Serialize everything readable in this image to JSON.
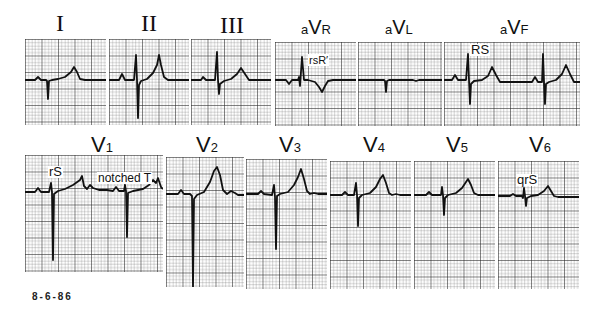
{
  "figure": {
    "date": "8-6-86",
    "colors": {
      "trace": "#111111",
      "grid_minor": "#555555",
      "grid_major": "#222222",
      "background": "#ffffff"
    }
  },
  "limb_leads": [
    {
      "id": "I",
      "label": "I",
      "prefix": "",
      "main": "",
      "sub": ""
    },
    {
      "id": "II",
      "label": "II",
      "prefix": "",
      "main": "",
      "sub": ""
    },
    {
      "id": "III",
      "label": "III",
      "prefix": "",
      "main": "",
      "sub": ""
    },
    {
      "id": "aVR",
      "label": "",
      "prefix": "a",
      "main": "V",
      "sub": "R",
      "annotation": "rsR′"
    },
    {
      "id": "aVL",
      "label": "",
      "prefix": "a",
      "main": "V",
      "sub": "L"
    },
    {
      "id": "aVF",
      "label": "",
      "prefix": "a",
      "main": "V",
      "sub": "F",
      "annotation": "RS"
    }
  ],
  "chest_leads": [
    {
      "id": "V1",
      "main": "V",
      "sub": "1",
      "annotation": "rS",
      "annotation2": "notched T"
    },
    {
      "id": "V2",
      "main": "V",
      "sub": "2"
    },
    {
      "id": "V3",
      "main": "V",
      "sub": "3"
    },
    {
      "id": "V4",
      "main": "V",
      "sub": "4"
    },
    {
      "id": "V5",
      "main": "V",
      "sub": "5"
    },
    {
      "id": "V6",
      "main": "V",
      "sub": "6",
      "annotation": "qrS"
    }
  ]
}
